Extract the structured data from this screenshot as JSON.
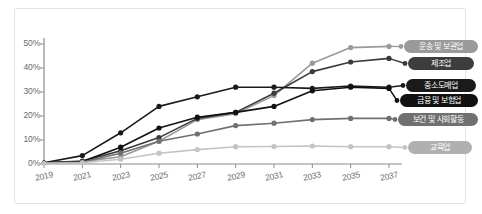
{
  "chart_data": {
    "type": "line",
    "title": "",
    "xlabel": "",
    "ylabel": "",
    "categories": [
      "2019",
      "2021",
      "2023",
      "2025",
      "2027",
      "2029",
      "2031",
      "2033",
      "2035",
      "2037"
    ],
    "ylim": [
      0,
      55
    ],
    "yticks": [
      "0%",
      "10%",
      "20%",
      "30%",
      "40%",
      "50%"
    ],
    "ytick_values": [
      0,
      10,
      20,
      30,
      40,
      50
    ],
    "grid": false,
    "legend_position": "right",
    "series": [
      {
        "name": "운송 및 보관업",
        "color": "#9a9a9a",
        "values": [
          0.5,
          1.0,
          3.0,
          9.5,
          18.5,
          21.0,
          28.5,
          42.0,
          48.5,
          49.0
        ]
      },
      {
        "name": "제조업",
        "color": "#3a3a3a",
        "values": [
          0.5,
          1.2,
          5.5,
          11.0,
          19.0,
          21.5,
          29.5,
          38.5,
          42.5,
          44.0
        ]
      },
      {
        "name": "중소도매업",
        "color": "#1a1a1a",
        "values": [
          0.5,
          3.5,
          13.0,
          24.0,
          28.0,
          32.0,
          32.0,
          31.5,
          32.5,
          32.0
        ]
      },
      {
        "name": "금융 및 보험업",
        "color": "#111111",
        "values": [
          0.5,
          1.0,
          7.0,
          15.0,
          19.5,
          21.5,
          24.0,
          30.5,
          32.0,
          31.5
        ]
      },
      {
        "name": "보건 및 사회활동",
        "color": "#707070",
        "values": [
          0.5,
          0.8,
          4.5,
          9.5,
          12.5,
          16.0,
          17.0,
          18.5,
          19.0,
          19.0
        ]
      },
      {
        "name": "교육업",
        "color": "#c4c4c4",
        "values": [
          0.3,
          0.5,
          2.0,
          4.5,
          6.0,
          7.2,
          7.3,
          7.5,
          7.2,
          7.2
        ]
      }
    ]
  },
  "legend": {
    "items": [
      {
        "label": "운송 및 보관업",
        "color": "#9a9a9a",
        "text_color": "#ffffff"
      },
      {
        "label": "제조업",
        "color": "#3d3d3d",
        "text_color": "#ffffff"
      },
      {
        "label": "중소도매업",
        "color": "#1a1a1a",
        "text_color": "#ffffff"
      },
      {
        "label": "금융 및 보험업",
        "color": "#111111",
        "text_color": "#ffffff"
      },
      {
        "label": "보건 및 사회활동",
        "color": "#707070",
        "text_color": "#ffffff"
      },
      {
        "label": "교육업",
        "color": "#b0b0b0",
        "text_color": "#ffffff"
      }
    ]
  },
  "axis": {
    "color": "#8c8c8c",
    "tick_color": "#8c8c8c",
    "label_color": "#6b6b6b"
  }
}
